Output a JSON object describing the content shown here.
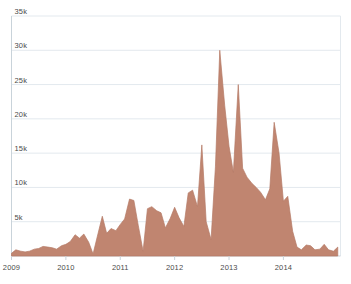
{
  "chart_data": {
    "type": "area",
    "title": "",
    "subtitle": "",
    "xlabel": "",
    "ylabel": "",
    "grid": true,
    "legend": "none",
    "series_name": "",
    "fill_color": "#c08570",
    "line_color": "#b47a66",
    "grid_color": "#e3e9ee",
    "axis_color": "#c9d3da",
    "text_color": "#4b4b4b",
    "background_color": "#ffffff",
    "ylim": [
      0,
      35000
    ],
    "ytick_values": [
      5000,
      10000,
      15000,
      20000,
      25000,
      30000,
      35000
    ],
    "ytick_labels": [
      "5k",
      "10k",
      "15k",
      "20k",
      "25k",
      "30k",
      "35k"
    ],
    "xlim": [
      2009.0,
      2015.05
    ],
    "xtick_values": [
      2009,
      2010,
      2011,
      2012,
      2013,
      2014
    ],
    "xtick_labels": [
      "2009",
      "2010",
      "2011",
      "2012",
      "2013",
      "2014"
    ],
    "x": [
      2009.0,
      2009.08,
      2009.17,
      2009.25,
      2009.33,
      2009.42,
      2009.5,
      2009.58,
      2009.67,
      2009.75,
      2009.83,
      2009.92,
      2010.0,
      2010.08,
      2010.17,
      2010.25,
      2010.33,
      2010.42,
      2010.5,
      2010.58,
      2010.67,
      2010.75,
      2010.83,
      2010.92,
      2011.0,
      2011.08,
      2011.17,
      2011.25,
      2011.33,
      2011.42,
      2011.5,
      2011.58,
      2011.67,
      2011.75,
      2011.83,
      2011.92,
      2012.0,
      2012.08,
      2012.17,
      2012.25,
      2012.33,
      2012.42,
      2012.5,
      2012.58,
      2012.67,
      2012.75,
      2012.83,
      2012.92,
      2013.0,
      2013.08,
      2013.17,
      2013.25,
      2013.33,
      2013.42,
      2013.5,
      2013.58,
      2013.67,
      2013.75,
      2013.83,
      2013.92,
      2014.0,
      2014.08,
      2014.17,
      2014.25,
      2014.33,
      2014.42,
      2014.5,
      2014.58,
      2014.67,
      2014.75,
      2014.83,
      2014.92,
      2015.0
    ],
    "values": [
      400,
      900,
      700,
      600,
      700,
      1000,
      1100,
      1400,
      1300,
      1200,
      1000,
      1500,
      1700,
      2100,
      3100,
      2600,
      3200,
      2000,
      300,
      2900,
      5800,
      3300,
      4000,
      3700,
      4600,
      5400,
      8300,
      8100,
      4500,
      700,
      6900,
      7200,
      6600,
      6300,
      4100,
      5500,
      7100,
      5600,
      4300,
      9200,
      9600,
      7200,
      16200,
      5000,
      2400,
      13000,
      30000,
      22000,
      16000,
      12200,
      25000,
      12800,
      11500,
      10600,
      10000,
      9300,
      8200,
      9800,
      19500,
      15000,
      8000,
      8700,
      3600,
      1300,
      900,
      1600,
      1500,
      900,
      1000,
      1700,
      900,
      700,
      1300
    ]
  }
}
